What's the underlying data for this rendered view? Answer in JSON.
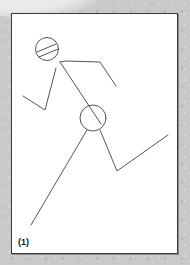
{
  "figure": {
    "label": "(1)",
    "colors": {
      "background": "#c9c9c9",
      "panel": "#ffffff",
      "border": "#3a3a3a",
      "stroke": "#555555"
    }
  }
}
